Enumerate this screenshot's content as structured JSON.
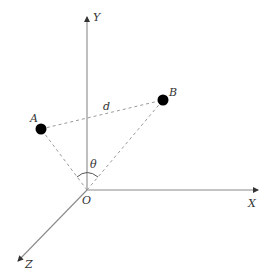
{
  "diagram": {
    "type": "3d-coordinate-system",
    "origin": {
      "label": "O",
      "x": 87,
      "y": 190
    },
    "axes": [
      {
        "name": "Y",
        "label": "Y",
        "from": [
          87,
          190
        ],
        "to": [
          87,
          16
        ],
        "label_pos": [
          93,
          21
        ]
      },
      {
        "name": "X",
        "label": "X",
        "from": [
          87,
          190
        ],
        "to": [
          259,
          190
        ],
        "label_pos": [
          248,
          207
        ]
      },
      {
        "name": "Z",
        "label": "Z",
        "from": [
          87,
          190
        ],
        "to": [
          17,
          262
        ],
        "label_pos": [
          25,
          268
        ]
      }
    ],
    "points": [
      {
        "name": "A",
        "label": "A",
        "x": 41,
        "y": 129,
        "label_pos": [
          30,
          122
        ]
      },
      {
        "name": "B",
        "label": "B",
        "x": 163,
        "y": 100,
        "label_pos": [
          169,
          96
        ]
      }
    ],
    "segments": [
      {
        "name": "distance-AB",
        "from": "A",
        "to": "B",
        "style": "dashed",
        "label": "d",
        "label_pos": [
          103,
          110
        ]
      },
      {
        "name": "OA",
        "from": "O",
        "to": "A",
        "style": "dashed"
      },
      {
        "name": "OB",
        "from": "O",
        "to": "B",
        "style": "dashed"
      }
    ],
    "angle": {
      "label": "θ",
      "vertex": "O",
      "between": [
        "A",
        "B"
      ],
      "label_pos": [
        90,
        168
      ]
    },
    "colors": {
      "axis": "#8a8a8a",
      "dashed": "#9a9a9a",
      "point": "#000000",
      "text": "#333333"
    }
  }
}
